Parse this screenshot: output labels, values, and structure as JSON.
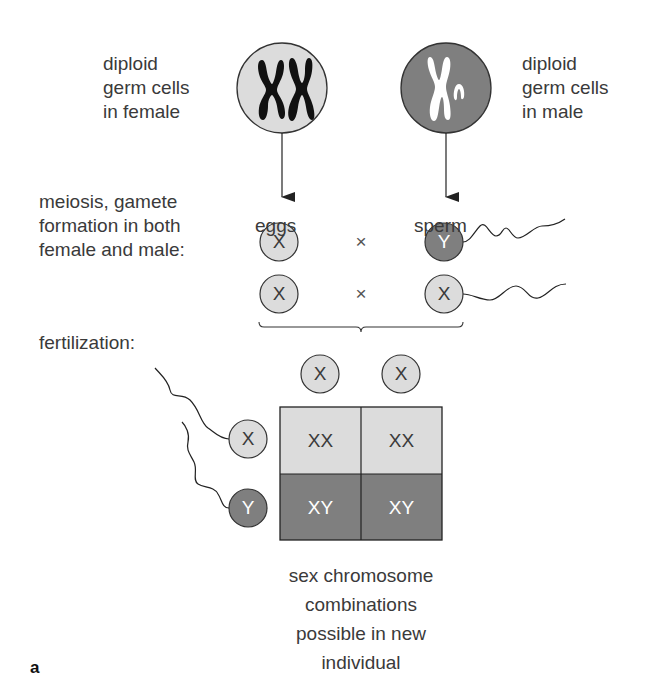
{
  "figure": {
    "panel_label": "a",
    "colors": {
      "light_cell": "#dcdcdc",
      "dark_cell": "#7f7f7f",
      "outline": "#333333",
      "text": "#3a3a3a",
      "light_text": "#ffffff"
    }
  },
  "parents": {
    "female": {
      "label_lines": [
        "diploid",
        "germ cells",
        "in female"
      ],
      "chromosomes": "XX"
    },
    "male": {
      "label_lines": [
        "diploid",
        "germ cells",
        "in male"
      ],
      "chromosomes": "XY"
    }
  },
  "meiosis": {
    "label_lines": [
      "meiosis, gamete",
      "formation in both",
      "female and male:"
    ],
    "eggs_label": "eggs",
    "sperm_label": "sperm",
    "cross_symbol": "×",
    "rows": [
      {
        "egg": "X",
        "sperm": "Y"
      },
      {
        "egg": "X",
        "sperm": "X"
      }
    ]
  },
  "fertilization": {
    "label": "fertilization:",
    "top_eggs": [
      "X",
      "X"
    ],
    "side_sperm": [
      "X",
      "Y"
    ],
    "grid": [
      [
        "XX",
        "XX"
      ],
      [
        "XY",
        "XY"
      ]
    ]
  },
  "caption": {
    "lines": [
      "sex chromosome",
      "combinations",
      "possible in new",
      "individual"
    ]
  }
}
